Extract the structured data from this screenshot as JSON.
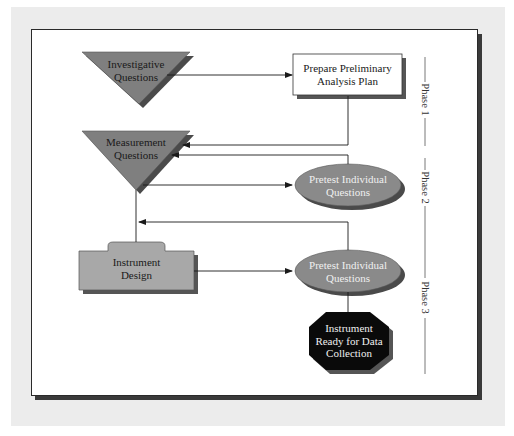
{
  "diagram": {
    "nodes": {
      "investigative_questions": {
        "line1": "Investigative",
        "line2": "Questions",
        "shape": "inverted-triangle",
        "color": "#7f7f7f"
      },
      "prepare_plan": {
        "line1": "Prepare Preliminary",
        "line2": "Analysis Plan",
        "shape": "rectangle",
        "color": "#ffffff"
      },
      "measurement_questions": {
        "line1": "Measurement",
        "line2": "Questions",
        "shape": "inverted-triangle",
        "color": "#7f7f7f"
      },
      "pretest_1": {
        "line1": "Pretest Individual",
        "line2": "Questions",
        "shape": "ellipse",
        "color": "#8a8a8a"
      },
      "instrument_design": {
        "line1": "Instrument",
        "line2": "Design",
        "shape": "tabbed-folder",
        "color": "#a8a8a8"
      },
      "pretest_2": {
        "line1": "Pretest Individual",
        "line2": "Questions",
        "shape": "ellipse",
        "color": "#8a8a8a"
      },
      "instrument_ready": {
        "line1": "Instrument",
        "line2": "Ready for Data",
        "line3": "Collection",
        "shape": "octagon",
        "color": "#0a0a0a"
      }
    },
    "edges": [
      {
        "from": "Investigative Questions",
        "to": "Prepare Preliminary Analysis Plan"
      },
      {
        "from": "Prepare Preliminary Analysis Plan",
        "to": "Measurement Questions"
      },
      {
        "from": "Pretest Individual Questions (1)",
        "to": "Measurement Questions"
      },
      {
        "from": "Measurement Questions",
        "to": "Pretest Individual Questions (1)"
      },
      {
        "from": "Measurement Questions",
        "to": "Instrument Design"
      },
      {
        "from": "Pretest Individual Questions (2)",
        "to": "Measurement Questions line"
      },
      {
        "from": "Instrument Design",
        "to": "Pretest Individual Questions (2)"
      },
      {
        "from": "Pretest Individual Questions (2)",
        "to": "Instrument Ready for Data Collection"
      }
    ],
    "phases": [
      {
        "label": "Phase 1"
      },
      {
        "label": "Phase 2"
      },
      {
        "label": "Phase 3"
      }
    ]
  }
}
